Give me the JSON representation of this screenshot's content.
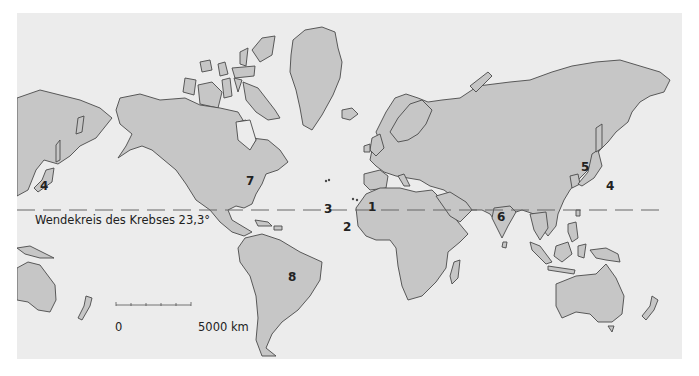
{
  "map": {
    "type": "world map (Mercator)",
    "colors": {
      "ocean": "#ececec",
      "land": "#c6c6c6",
      "outline": "#4a4a4a",
      "tropic_line": "#666666"
    },
    "tropic_line": {
      "label": "Wendekreis des Krebses 23,3°"
    },
    "scale_bar": {
      "start_label": "0",
      "end_label": "5000 km"
    },
    "region_labels": [
      {
        "id": "1",
        "text": "1",
        "location": "Iberia"
      },
      {
        "id": "2",
        "text": "2",
        "location": "Canary Islands"
      },
      {
        "id": "3",
        "text": "3",
        "location": "Azores"
      },
      {
        "id": "4a",
        "text": "4",
        "location": "Japan (left edge)"
      },
      {
        "id": "4b",
        "text": "4",
        "location": "Japan"
      },
      {
        "id": "5a",
        "text": "5",
        "location": "East Asia coast (left edge)"
      },
      {
        "id": "5b",
        "text": "5",
        "location": "East Asia coast"
      },
      {
        "id": "6",
        "text": "6",
        "location": "India"
      },
      {
        "id": "7",
        "text": "7",
        "location": "Eastern North America"
      },
      {
        "id": "8",
        "text": "8",
        "location": "South America"
      }
    ]
  }
}
